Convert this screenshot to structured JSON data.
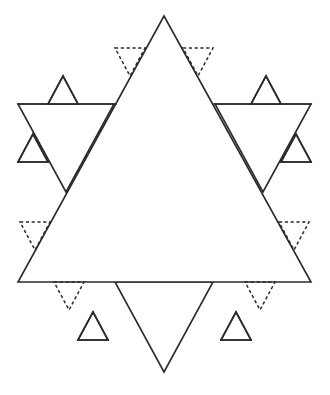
{
  "figure": {
    "canvas": {
      "width": 330,
      "height": 395
    },
    "colors": {
      "background": "#ffffff",
      "stroke": "#2b2b2b",
      "fill": "#ffffff"
    },
    "line_styles": {
      "solid_label": "cut line",
      "dashed_label": "fold line",
      "solid_width": 1.6,
      "dashed_width": 1.5,
      "dash_pattern": "3.2 2.6"
    },
    "geometry": {
      "big_triangle": {
        "name": "large-upward-triangle",
        "style": "solid",
        "points": "164,16 311,282 18,282"
      },
      "horizontal_band": {
        "name": "upper-horizontal-line",
        "style": "solid",
        "points": "18,104 311,104",
        "y": 104,
        "x_start": 18,
        "x_end": 311
      },
      "down_triangle_left_wing": {
        "name": "left-downward-wing-triangle",
        "style": "solid",
        "points": "18,104 114,104 66,192"
      },
      "down_triangle_right_wing": {
        "name": "right-downward-wing-triangle",
        "style": "solid",
        "points": "215,104 311,104 263,192"
      },
      "bottom_down_triangle": {
        "name": "bottom-downward-triangle",
        "style": "solid",
        "points": "115,282 213,282 164,372"
      },
      "small_solid_triangles": [
        {
          "name": "small-triangle-upper-left",
          "style": "solid",
          "points": "48,104 78,104 63,76"
        },
        {
          "name": "small-triangle-upper-right",
          "style": "solid",
          "points": "251,104 281,104 266,76"
        },
        {
          "name": "small-triangle-mid-left",
          "style": "solid",
          "points": "18,162 48,162 33,134"
        },
        {
          "name": "small-triangle-mid-right",
          "style": "solid",
          "points": "281,162 311,162 296,134"
        },
        {
          "name": "small-triangle-bottom-left",
          "style": "solid",
          "points": "78,340 108,340 93,312"
        },
        {
          "name": "small-triangle-bottom-right",
          "style": "solid",
          "points": "221,340 251,340 236,312"
        }
      ],
      "dashed_triangles": [
        {
          "name": "dashed-triangle-top-left",
          "style": "dashed",
          "points": "115,48 145,48 130,76"
        },
        {
          "name": "dashed-triangle-top-right",
          "style": "dashed",
          "points": "183,48 213,48 198,76"
        },
        {
          "name": "dashed-triangle-left",
          "style": "dashed",
          "points": "20,222 50,222 35,250"
        },
        {
          "name": "dashed-triangle-right",
          "style": "dashed",
          "points": "279,222 309,222 294,250"
        },
        {
          "name": "dashed-triangle-bottom-left",
          "style": "dashed",
          "points": "54,282 84,282 69,310"
        },
        {
          "name": "dashed-triangle-bottom-right",
          "style": "dashed",
          "points": "245,282 275,282 260,310"
        }
      ]
    }
  }
}
